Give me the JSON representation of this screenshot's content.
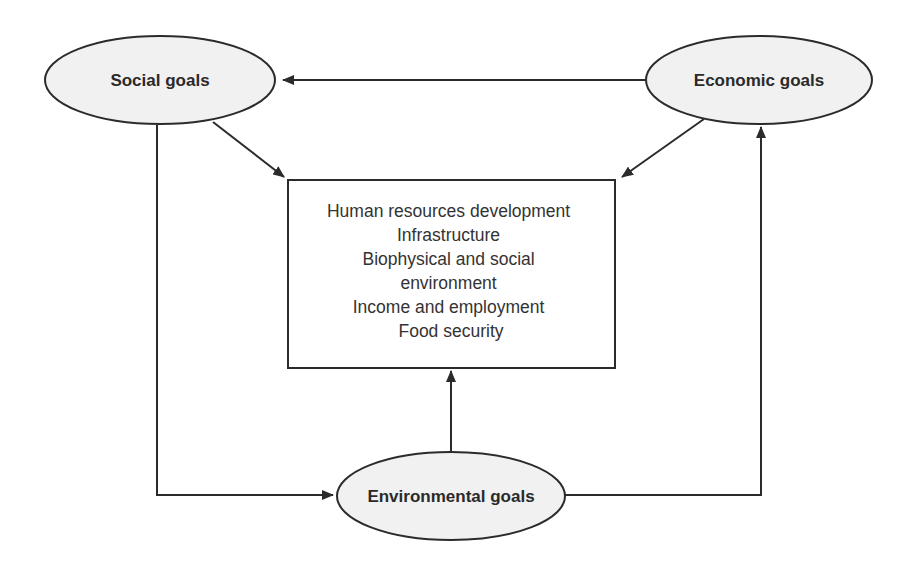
{
  "diagram": {
    "nodes": {
      "social": {
        "label": "Social goals"
      },
      "economic": {
        "label": "Economic goals"
      },
      "environmental": {
        "label": "Environmental goals"
      }
    },
    "center_box": {
      "lines": [
        "Human resources development",
        "Infrastructure",
        "Biophysical and social",
        "environment",
        "Income and employment",
        "Food security"
      ]
    },
    "edges": [
      {
        "from": "Economic goals",
        "to": "Social goals"
      },
      {
        "from": "Social goals",
        "to": "center_box"
      },
      {
        "from": "Economic goals",
        "to": "center_box"
      },
      {
        "from": "Environmental goals",
        "to": "center_box"
      },
      {
        "from": "Social goals",
        "to": "Environmental goals"
      },
      {
        "from": "Environmental goals",
        "to": "Economic goals"
      }
    ],
    "colors": {
      "stroke": "#2b2b2b",
      "ellipse_fill": "#f1f1f1",
      "text": "#2a2a2a"
    }
  }
}
